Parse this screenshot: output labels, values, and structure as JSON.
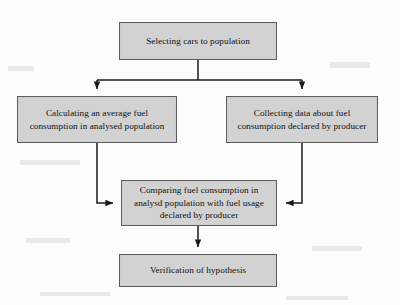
{
  "diagram": {
    "type": "flowchart",
    "orientation": "top-to-bottom",
    "style": {
      "node_fill": "#d2d2d2",
      "node_border": "#5d5d5d",
      "connector_color": "#1a1a1a",
      "background": "#fdfdfc",
      "text_color": "#111111"
    },
    "nodes": [
      {
        "id": "select",
        "label": "Selecting cars to population",
        "shape": "rectangle",
        "level": 1
      },
      {
        "id": "average",
        "label": "Calculating an average fuel consumption in analysed population",
        "shape": "rectangle",
        "level": 2
      },
      {
        "id": "collect",
        "label": "Collecting data about fuel consumption declared by producer",
        "shape": "rectangle",
        "level": 2
      },
      {
        "id": "compare",
        "label": "Comparing fuel consumption in analysd population with fuel usage declared by producer",
        "shape": "rectangle",
        "level": 3
      },
      {
        "id": "verify",
        "label": "Verification of hypothesis",
        "shape": "rectangle",
        "level": 4
      }
    ],
    "edges": [
      {
        "from": "select",
        "to": "average",
        "style": "elbow",
        "arrow": "filled-triangle",
        "enters": "top"
      },
      {
        "from": "select",
        "to": "collect",
        "style": "elbow",
        "arrow": "filled-triangle",
        "enters": "top"
      },
      {
        "from": "average",
        "to": "compare",
        "style": "elbow",
        "arrow": "filled-triangle",
        "enters": "left"
      },
      {
        "from": "collect",
        "to": "compare",
        "style": "elbow",
        "arrow": "filled-triangle",
        "enters": "right"
      },
      {
        "from": "compare",
        "to": "verify",
        "style": "straight",
        "arrow": "filled-triangle",
        "enters": "top"
      }
    ]
  }
}
